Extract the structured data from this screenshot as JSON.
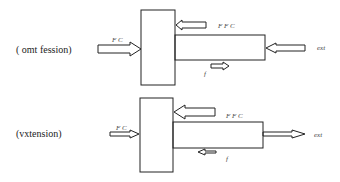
{
  "diagrams": [
    {
      "label": "(  omt fession)",
      "left_arrow_label": "F  C",
      "top_labels": "F    F    C",
      "rod_end_label": "ext",
      "bottom_label": "f"
    },
    {
      "label": "(vxtension)",
      "left_arrow_label": "F  C",
      "top_labels": "F    F    C",
      "rod_end_label": "ext",
      "bottom_label": "f"
    }
  ],
  "colors": {
    "stroke": "#222222",
    "background": "#ffffff"
  }
}
